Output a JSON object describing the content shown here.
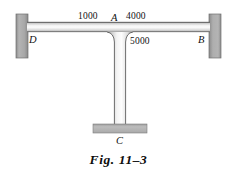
{
  "figure": {
    "caption": "Fig. 11–3",
    "type": "structural-frame-diagram",
    "background_color": "#ffffff",
    "ink_color": "#111111"
  },
  "labels": {
    "span_left": "1000",
    "span_right": "4000",
    "column_length": "5000",
    "joint_top": "A",
    "support_left": "D",
    "support_right": "B",
    "support_bottom": "C"
  },
  "colors": {
    "support_fill": "#a9a9a9",
    "support_edge": "#6f6f6f",
    "member_light": "#fdfdfd",
    "member_mid": "#d6d6d6",
    "member_dark": "#8e8e8e",
    "outline": "#4a4a4a",
    "base_plate": "#b3b3b3"
  },
  "geometry": {
    "beam": {
      "x": 34,
      "y": 22,
      "width": 176,
      "height": 10
    },
    "column": {
      "x": 114,
      "y": 32,
      "width": 12,
      "height": 92
    },
    "base_plate": {
      "x": 93,
      "y": 124,
      "width": 54,
      "height": 9
    },
    "support_left": {
      "x": 16,
      "y": 14,
      "width": 12,
      "height": 44
    },
    "support_right": {
      "x": 209,
      "y": 14,
      "width": 12,
      "height": 44
    }
  }
}
